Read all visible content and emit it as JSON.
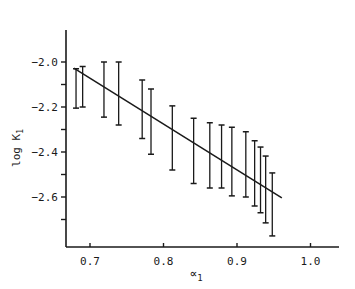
{
  "chart_data": {
    "type": "scatter",
    "title": "",
    "xlabel": "∝1",
    "ylabel": "log K1",
    "xlim": [
      0.67,
      1.03
    ],
    "ylim": [
      -2.8,
      -1.82
    ],
    "x_ticks": [
      0.7,
      0.8,
      0.9,
      1.0
    ],
    "x_tick_labels": [
      "0.7",
      "0.8",
      "0.9",
      "1.0"
    ],
    "y_ticks": [
      -2.0,
      -2.1,
      -2.2,
      -2.3,
      -2.4,
      -2.5,
      -2.6,
      -2.7
    ],
    "y_tick_labels": [
      "-2.0",
      "",
      "-2.2",
      "",
      "-2.4",
      "",
      "-2.6",
      ""
    ],
    "grid": false,
    "legend": null,
    "series": [
      {
        "name": "error bars",
        "kind": "errorbar",
        "points": [
          {
            "x": 0.681,
            "low": -2.205,
            "high": -2.03
          },
          {
            "x": 0.69,
            "low": -2.2,
            "high": -2.02
          },
          {
            "x": 0.719,
            "low": -2.245,
            "high": -2.0
          },
          {
            "x": 0.739,
            "low": -2.28,
            "high": -2.0
          },
          {
            "x": 0.771,
            "low": -2.34,
            "high": -2.08
          },
          {
            "x": 0.783,
            "low": -2.41,
            "high": -2.12
          },
          {
            "x": 0.812,
            "low": -2.48,
            "high": -2.195
          },
          {
            "x": 0.841,
            "low": -2.54,
            "high": -2.25
          },
          {
            "x": 0.863,
            "low": -2.56,
            "high": -2.27
          },
          {
            "x": 0.879,
            "low": -2.56,
            "high": -2.28
          },
          {
            "x": 0.893,
            "low": -2.595,
            "high": -2.29
          },
          {
            "x": 0.912,
            "low": -2.6,
            "high": -2.31
          },
          {
            "x": 0.924,
            "low": -2.64,
            "high": -2.35
          },
          {
            "x": 0.932,
            "low": -2.67,
            "high": -2.378
          },
          {
            "x": 0.939,
            "low": -2.715,
            "high": -2.418
          },
          {
            "x": 0.948,
            "low": -2.773,
            "high": -2.493
          }
        ]
      },
      {
        "name": "fit line",
        "kind": "line",
        "x": [
          0.678,
          0.961
        ],
        "y": [
          -2.027,
          -2.604
        ]
      }
    ]
  },
  "labels": {
    "y_axis": "log K",
    "y_axis_sub": "1",
    "x_axis": "∝",
    "x_axis_sub": "1"
  }
}
